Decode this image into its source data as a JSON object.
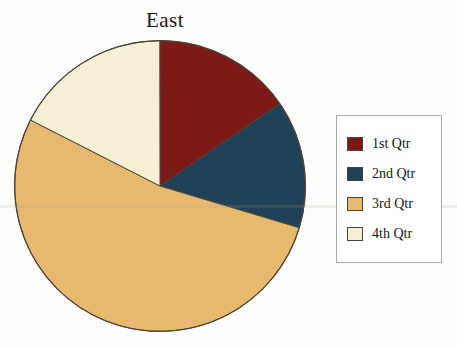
{
  "chart_data": {
    "type": "pie",
    "title": "East",
    "xlabel": "",
    "ylabel": "",
    "legend_position": "right",
    "grid": false,
    "categories": [
      "1st Qtr",
      "2nd Qtr",
      "3rd Qtr",
      "4th Qtr"
    ],
    "values": [
      15.4,
      14.2,
      52.9,
      17.5
    ],
    "slice_angles_deg": [
      55.5,
      51.2,
      190.3,
      62.9
    ],
    "start_angle_deg": 0,
    "direction": "clockwise",
    "colors": [
      "#7d1917",
      "#214157",
      "#e7b96f",
      "#f6efd4"
    ],
    "series": [
      {
        "name": "East",
        "values": [
          15.4,
          14.2,
          52.9,
          17.5
        ]
      }
    ]
  },
  "chart": {
    "title": "East"
  },
  "legend": {
    "items": [
      {
        "label": "1st Qtr",
        "color": "#7d1917"
      },
      {
        "label": "2nd Qtr",
        "color": "#214157"
      },
      {
        "label": "3rd Qtr",
        "color": "#e7b96f"
      },
      {
        "label": "4th Qtr",
        "color": "#f6efd4"
      }
    ]
  },
  "figure": {
    "caption": ""
  },
  "style": {
    "pie_outline": "#4a4438",
    "legend_border": "#a9a9ad",
    "page_background": "#fdfdfb"
  }
}
